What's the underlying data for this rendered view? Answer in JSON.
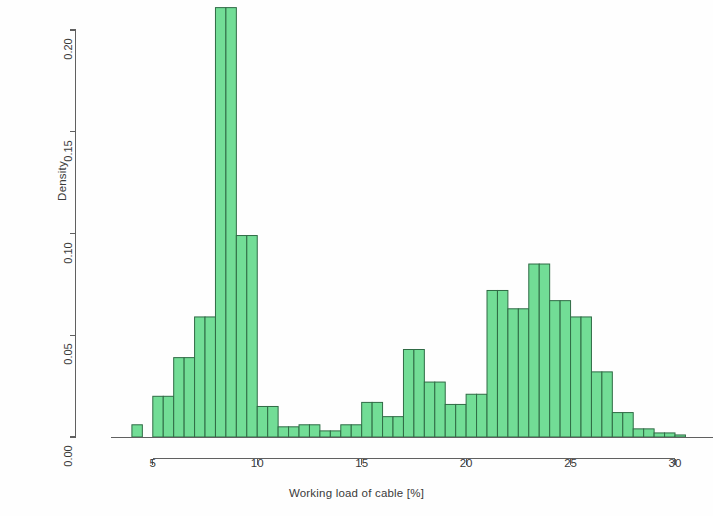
{
  "chart_data": {
    "type": "bar",
    "subtype": "histogram",
    "title": "",
    "xlabel": "Working load of cable [%]",
    "ylabel": "Density",
    "xlim": [
      3.4,
      31.2
    ],
    "ylim": [
      0.0,
      0.215
    ],
    "xticks": [
      5,
      10,
      15,
      20,
      25,
      30
    ],
    "xtick_labels": [
      "5",
      "10",
      "15",
      "20",
      "25",
      "30"
    ],
    "yticks": [
      0.0,
      0.05,
      0.1,
      0.15,
      0.2
    ],
    "ytick_labels": [
      "0.00",
      "0.05",
      "0.10",
      "0.15",
      "0.20"
    ],
    "grid": false,
    "legend": null,
    "bin_width": 0.5,
    "bin_edges": [
      4.0,
      4.5,
      5.0,
      5.5,
      6.0,
      6.5,
      7.0,
      7.5,
      8.0,
      8.5,
      9.0,
      9.5,
      10.0,
      10.5,
      11.0,
      11.5,
      12.0,
      12.5,
      13.0,
      13.5,
      14.0,
      14.5,
      15.0,
      15.5,
      16.0,
      16.5,
      17.0,
      17.5,
      18.0,
      18.5,
      19.0,
      19.5,
      20.0,
      20.5,
      21.0,
      21.5,
      22.0,
      22.5,
      23.0,
      23.5,
      24.0,
      24.5,
      25.0,
      25.5,
      26.0,
      26.5,
      27.0,
      27.5,
      28.0,
      28.5,
      29.0,
      29.5,
      30.0,
      30.5
    ],
    "bin_centers": [
      4.25,
      4.75,
      5.25,
      5.75,
      6.25,
      6.75,
      7.25,
      7.75,
      8.25,
      8.75,
      9.25,
      9.75,
      10.25,
      10.75,
      11.25,
      11.75,
      12.25,
      12.75,
      13.25,
      13.75,
      14.25,
      14.75,
      15.25,
      15.75,
      16.25,
      16.75,
      17.25,
      17.75,
      18.25,
      18.75,
      19.25,
      19.75,
      20.25,
      20.75,
      21.25,
      21.75,
      22.25,
      22.75,
      23.25,
      23.75,
      24.25,
      24.75,
      25.25,
      25.75,
      26.25,
      26.75,
      27.25,
      27.75,
      28.25,
      28.75,
      29.25,
      29.75,
      30.25
    ],
    "values": [
      0.006,
      0.0,
      0.02,
      0.02,
      0.039,
      0.039,
      0.059,
      0.059,
      0.211,
      0.211,
      0.099,
      0.099,
      0.015,
      0.015,
      0.005,
      0.005,
      0.006,
      0.006,
      0.003,
      0.003,
      0.006,
      0.006,
      0.017,
      0.017,
      0.01,
      0.01,
      0.043,
      0.043,
      0.027,
      0.027,
      0.016,
      0.016,
      0.021,
      0.021,
      0.072,
      0.072,
      0.063,
      0.063,
      0.085,
      0.085,
      0.067,
      0.067,
      0.059,
      0.059,
      0.032,
      0.032,
      0.012,
      0.012,
      0.004,
      0.004,
      0.002,
      0.002,
      0.001
    ],
    "bars": [
      {
        "x0": 4.0,
        "x1": 4.5,
        "density": 0.006
      },
      {
        "x0": 4.5,
        "x1": 5.0,
        "density": 0.0
      },
      {
        "x0": 5.0,
        "x1": 5.5,
        "density": 0.02
      },
      {
        "x0": 5.5,
        "x1": 6.0,
        "density": 0.02
      },
      {
        "x0": 6.0,
        "x1": 6.5,
        "density": 0.039
      },
      {
        "x0": 6.5,
        "x1": 7.0,
        "density": 0.039
      },
      {
        "x0": 7.0,
        "x1": 7.5,
        "density": 0.059
      },
      {
        "x0": 7.5,
        "x1": 8.0,
        "density": 0.059
      },
      {
        "x0": 8.0,
        "x1": 8.5,
        "density": 0.211
      },
      {
        "x0": 8.5,
        "x1": 9.0,
        "density": 0.211
      },
      {
        "x0": 9.0,
        "x1": 9.5,
        "density": 0.099
      },
      {
        "x0": 9.5,
        "x1": 10.0,
        "density": 0.099
      },
      {
        "x0": 10.0,
        "x1": 10.5,
        "density": 0.015
      },
      {
        "x0": 10.5,
        "x1": 11.0,
        "density": 0.015
      },
      {
        "x0": 11.0,
        "x1": 11.5,
        "density": 0.005
      },
      {
        "x0": 11.5,
        "x1": 12.0,
        "density": 0.005
      },
      {
        "x0": 12.0,
        "x1": 12.5,
        "density": 0.006
      },
      {
        "x0": 12.5,
        "x1": 13.0,
        "density": 0.006
      },
      {
        "x0": 13.0,
        "x1": 13.5,
        "density": 0.003
      },
      {
        "x0": 13.5,
        "x1": 14.0,
        "density": 0.003
      },
      {
        "x0": 14.0,
        "x1": 14.5,
        "density": 0.006
      },
      {
        "x0": 14.5,
        "x1": 15.0,
        "density": 0.006
      },
      {
        "x0": 15.0,
        "x1": 15.5,
        "density": 0.017
      },
      {
        "x0": 15.5,
        "x1": 16.0,
        "density": 0.017
      },
      {
        "x0": 16.0,
        "x1": 16.5,
        "density": 0.01
      },
      {
        "x0": 16.5,
        "x1": 17.0,
        "density": 0.01
      },
      {
        "x0": 17.0,
        "x1": 17.5,
        "density": 0.043
      },
      {
        "x0": 17.5,
        "x1": 18.0,
        "density": 0.043
      },
      {
        "x0": 18.0,
        "x1": 18.5,
        "density": 0.027
      },
      {
        "x0": 18.5,
        "x1": 19.0,
        "density": 0.027
      },
      {
        "x0": 19.0,
        "x1": 19.5,
        "density": 0.016
      },
      {
        "x0": 19.5,
        "x1": 20.0,
        "density": 0.016
      },
      {
        "x0": 20.0,
        "x1": 20.5,
        "density": 0.021
      },
      {
        "x0": 20.5,
        "x1": 21.0,
        "density": 0.021
      },
      {
        "x0": 21.0,
        "x1": 21.5,
        "density": 0.072
      },
      {
        "x0": 21.5,
        "x1": 22.0,
        "density": 0.072
      },
      {
        "x0": 22.0,
        "x1": 22.5,
        "density": 0.063
      },
      {
        "x0": 22.5,
        "x1": 23.0,
        "density": 0.063
      },
      {
        "x0": 23.0,
        "x1": 23.5,
        "density": 0.085
      },
      {
        "x0": 23.5,
        "x1": 24.0,
        "density": 0.085
      },
      {
        "x0": 24.0,
        "x1": 24.5,
        "density": 0.067
      },
      {
        "x0": 24.5,
        "x1": 25.0,
        "density": 0.067
      },
      {
        "x0": 25.0,
        "x1": 25.5,
        "density": 0.059
      },
      {
        "x0": 25.5,
        "x1": 26.0,
        "density": 0.059
      },
      {
        "x0": 26.0,
        "x1": 26.5,
        "density": 0.032
      },
      {
        "x0": 26.5,
        "x1": 27.0,
        "density": 0.032
      },
      {
        "x0": 27.0,
        "x1": 27.5,
        "density": 0.012
      },
      {
        "x0": 27.5,
        "x1": 28.0,
        "density": 0.012
      },
      {
        "x0": 28.0,
        "x1": 28.5,
        "density": 0.004
      },
      {
        "x0": 28.5,
        "x1": 29.0,
        "density": 0.004
      },
      {
        "x0": 29.0,
        "x1": 29.5,
        "density": 0.002
      },
      {
        "x0": 29.5,
        "x1": 30.0,
        "density": 0.002
      },
      {
        "x0": 30.0,
        "x1": 30.5,
        "density": 0.001
      }
    ],
    "style": {
      "bar_fill": "#72dd96",
      "bar_stroke": "#2f6b45",
      "axis_color": "#606060",
      "text_color": "#3a3a3a",
      "background": "#ffffff"
    }
  }
}
